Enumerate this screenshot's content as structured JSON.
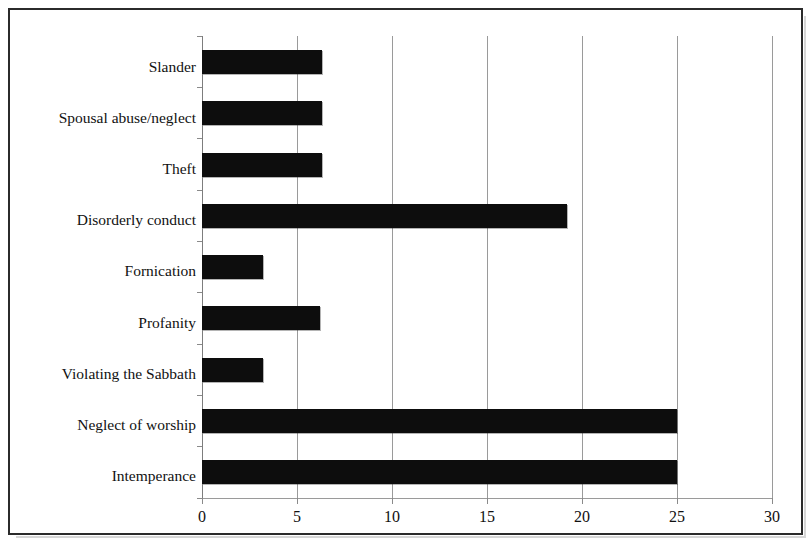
{
  "chart_data": {
    "type": "bar",
    "orientation": "horizontal",
    "title": "",
    "subtitle": "",
    "xlabel": "",
    "ylabel": "",
    "categories": [
      "Intemperance",
      "Neglect of worship",
      "Violating the Sabbath",
      "Profanity",
      "Fornication",
      "Disorderly conduct",
      "Theft",
      "Spousal abuse/neglect",
      "Slander"
    ],
    "values": [
      25,
      25,
      3.2,
      6.2,
      3.2,
      19.2,
      6.3,
      6.3,
      6.3
    ],
    "xlim": [
      0,
      30
    ],
    "xticks": [
      0,
      5,
      10,
      15,
      20,
      25,
      30
    ],
    "xtick_labels": [
      "0",
      "5",
      "10",
      "15",
      "20",
      "25",
      "30"
    ],
    "grid": true,
    "grid_axis": "x",
    "legend": false,
    "bar_color": "#0d0d0d",
    "gridline_color": "#9a9a9a",
    "frame_color": "#2b2b2b"
  }
}
